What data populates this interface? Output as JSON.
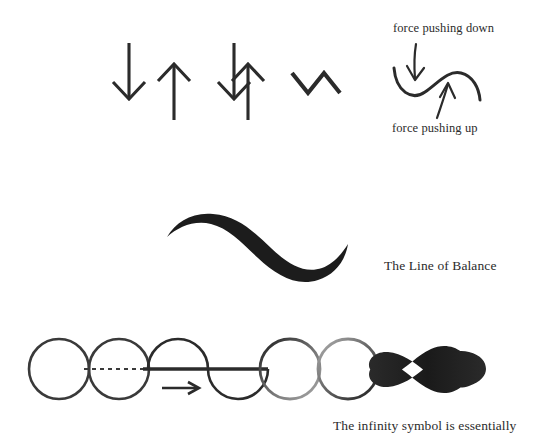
{
  "page": {
    "title": "The Line of Balance",
    "background_color": "#ffffff",
    "ink_color": "#2b2b2b",
    "width": 538,
    "height": 439
  },
  "captions": {
    "force_pushing_down": "force pushing down",
    "force_pushing_up": "force pushing up",
    "line_of_balance": "The Line of Balance",
    "infinity_symbol": "The infinity symbol is essentially"
  },
  "figures": {
    "row_top": {
      "name": "force-arrows-row",
      "items": [
        {
          "name": "opposing-arrows-separated",
          "description": "A downward arrow beside an upward arrow, offset side by side",
          "arrows": [
            "arrow-down",
            "arrow-up"
          ]
        },
        {
          "name": "opposing-arrows-overlapping",
          "description": "A downward arrow and an upward arrow crossing through each other",
          "arrows": [
            "arrow-down",
            "arrow-up"
          ]
        },
        {
          "name": "zigzag-angle",
          "description": "A sharp zigzag: down stroke, up stroke, down stroke"
        },
        {
          "name": "s-curve-with-force-arrows",
          "description": "A smooth S-curve with a down arrow into the trough and an up arrow into the crest",
          "arrows": [
            "arrow-down",
            "arrow-up"
          ]
        }
      ]
    },
    "row_middle": {
      "name": "line-of-balance-stroke",
      "description": "A thick tapered calligraphic brush S-curve representing the line of balance"
    },
    "row_bottom": {
      "name": "circle-to-infinity-sequence",
      "items": [
        {
          "name": "plain-circle",
          "description": "An outlined circle"
        },
        {
          "name": "circle-with-dashed-diameter",
          "description": "An outlined circle bisected by a horizontal dashed line"
        },
        {
          "name": "split-circle-sine",
          "description": "Circle halves shifted into a sine wave across a horizontal axis, with a rightward arrow showing the motion",
          "arrows": [
            "arrow-right"
          ]
        },
        {
          "name": "two-tangent-circles",
          "description": "Two circles of equal size touching side by side"
        },
        {
          "name": "infinity-symbol",
          "description": "A lemniscate, the infinity symbol"
        }
      ]
    }
  }
}
